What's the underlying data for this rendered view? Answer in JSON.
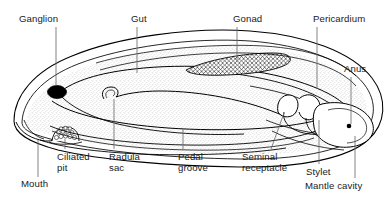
{
  "figure": {
    "organism_outline_color": "#000000",
    "background_color": "#ffffff",
    "label_color": "#1a1a1a",
    "ganglion_fill_color": "#000000",
    "gonad_hatch_color": "#000000",
    "stipple_color": "#9a9a9a"
  },
  "labels": [
    {
      "id": "ganglion",
      "text": "Ganglion",
      "line2": "",
      "x": 19,
      "y": 13,
      "align": "left"
    },
    {
      "id": "gut",
      "text": "Gut",
      "line2": "",
      "x": 131,
      "y": 13,
      "align": "left"
    },
    {
      "id": "gonad",
      "text": "Gonad",
      "line2": "",
      "x": 233,
      "y": 13,
      "align": "left"
    },
    {
      "id": "pericardium",
      "text": "Pericardium",
      "line2": "",
      "x": 313,
      "y": 13,
      "align": "left"
    },
    {
      "id": "anus",
      "text": "Anus",
      "line2": "",
      "x": 344,
      "y": 63,
      "align": "left"
    },
    {
      "id": "ciliated-pit",
      "text": "Ciliated",
      "line2": "pit",
      "x": 57,
      "y": 151,
      "align": "left"
    },
    {
      "id": "radula-sac",
      "text": "Radula",
      "line2": "sac",
      "x": 109,
      "y": 151,
      "align": "left"
    },
    {
      "id": "pedal-groove",
      "text": "Pedal",
      "line2": "groove",
      "x": 178,
      "y": 151,
      "align": "left"
    },
    {
      "id": "seminal-receptacle",
      "text": "Seminal",
      "line2": "receptacle",
      "x": 242,
      "y": 151,
      "align": "left"
    },
    {
      "id": "stylet",
      "text": "Stylet",
      "line2": "",
      "x": 306,
      "y": 166,
      "align": "left"
    },
    {
      "id": "mouth",
      "text": "Mouth",
      "line2": "",
      "x": 21,
      "y": 178,
      "align": "left"
    },
    {
      "id": "mantle-cavity",
      "text": "Mantle cavity",
      "line2": "",
      "x": 305,
      "y": 180,
      "align": "left"
    }
  ],
  "leader_lines": [
    {
      "id": "ganglion-leader",
      "points": "56,27 56,86"
    },
    {
      "id": "gut-leader",
      "points": "137,27 137,73"
    },
    {
      "id": "gonad-leader",
      "points": "237,27 237,62"
    },
    {
      "id": "pericardium-leader",
      "points": "317,27 317,88"
    },
    {
      "id": "anus-leader",
      "points": "351,77 351,126"
    },
    {
      "id": "ciliated-pit-leader",
      "points": "65,148 65,138"
    },
    {
      "id": "radula-sac-leader",
      "points": "114,148 114,99"
    },
    {
      "id": "pedal-groove-leader",
      "points": "183,148 183,128"
    },
    {
      "id": "seminal-receptacle-leader",
      "points": "271,148 284,112"
    },
    {
      "id": "stylet-leader",
      "points": "319,163 319,120"
    },
    {
      "id": "mouth-leader",
      "points": "38,176 38,139"
    },
    {
      "id": "mantle-cavity-leader",
      "points": "355,177 355,135"
    }
  ],
  "structures": [
    {
      "id": "body-outer-wall",
      "name": "body-outline"
    },
    {
      "id": "mantle-inner-wall",
      "name": "mantle-inner-line"
    },
    {
      "id": "gut-region",
      "name": "gut-cavity"
    },
    {
      "id": "gonad-region",
      "name": "gonad-crosshatch"
    },
    {
      "id": "ganglion-blob",
      "name": "ganglion"
    },
    {
      "id": "ciliated-pit-group",
      "name": "ciliated-pit"
    },
    {
      "id": "radula-sac-curve",
      "name": "radula-sac"
    },
    {
      "id": "pedal-groove-line",
      "name": "pedal-groove"
    },
    {
      "id": "posterior-chamber",
      "name": "mantle-cavity"
    },
    {
      "id": "stylet-shape",
      "name": "stylet"
    },
    {
      "id": "anus-point",
      "name": "anus"
    }
  ]
}
